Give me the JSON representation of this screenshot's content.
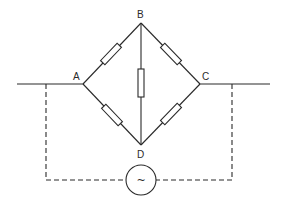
{
  "diagram": {
    "nodes": [
      {
        "id": "A",
        "label": "A",
        "x": 83,
        "y": 84
      },
      {
        "id": "B",
        "label": "B",
        "x": 141,
        "y": 23
      },
      {
        "id": "C",
        "label": "C",
        "x": 200,
        "y": 84
      },
      {
        "id": "D",
        "label": "D",
        "x": 141,
        "y": 145
      }
    ],
    "resistors": [
      {
        "between": [
          "A",
          "B"
        ]
      },
      {
        "between": [
          "B",
          "C"
        ]
      },
      {
        "between": [
          "A",
          "D"
        ]
      },
      {
        "between": [
          "D",
          "C"
        ]
      },
      {
        "between": [
          "B",
          "D"
        ]
      }
    ],
    "source": {
      "symbol": "~",
      "type": "AC source"
    },
    "connections": "dashed loop from supply leads to AC source",
    "colors": {
      "line": "#2a2a2a",
      "background": "#ffffff"
    }
  }
}
